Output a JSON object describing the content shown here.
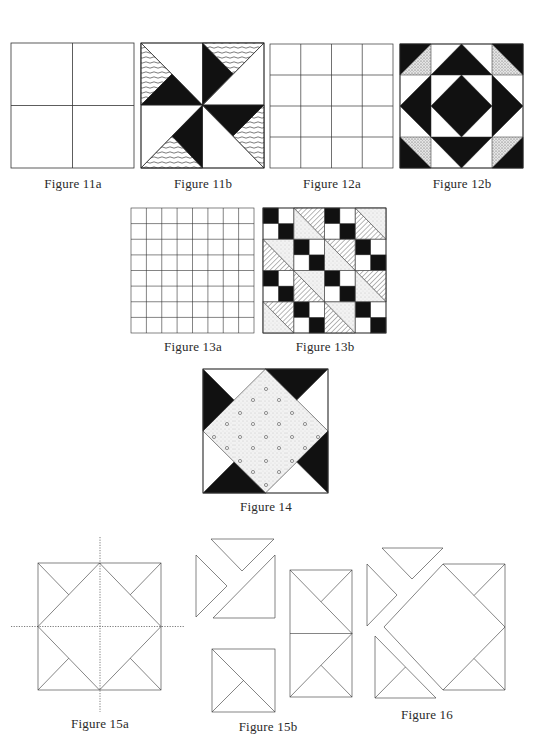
{
  "figures": {
    "fig11a": {
      "caption": "Figure 11a",
      "description": "2x2 grid"
    },
    "fig11b": {
      "caption": "Figure 11b",
      "description": "pinwheel block with black and hatched triangles"
    },
    "fig12a": {
      "caption": "Figure 12a",
      "description": "4x4 grid"
    },
    "fig12b": {
      "caption": "Figure 12b",
      "description": "block with black diamond center, black and dotted triangles"
    },
    "fig13a": {
      "caption": "Figure 13a",
      "description": "8x8 grid"
    },
    "fig13b": {
      "caption": "Figure 13b",
      "description": "four-patch and half-square triangle blocks in diagonal arrangement"
    },
    "fig14": {
      "caption": "Figure 14",
      "description": "dotted diamond center with black corner triangles"
    },
    "fig15a": {
      "caption": "Figure 15a",
      "description": "block outline with dotted centre axes"
    },
    "fig15b": {
      "caption": "Figure 15b",
      "description": "exploded block pieces"
    },
    "fig16": {
      "caption": "Figure 16",
      "description": "exploded block pieces"
    }
  },
  "colors": {
    "ink": "#1a1a1a",
    "paper": "#ffffff",
    "dot_fill": "#dcdcdc"
  }
}
